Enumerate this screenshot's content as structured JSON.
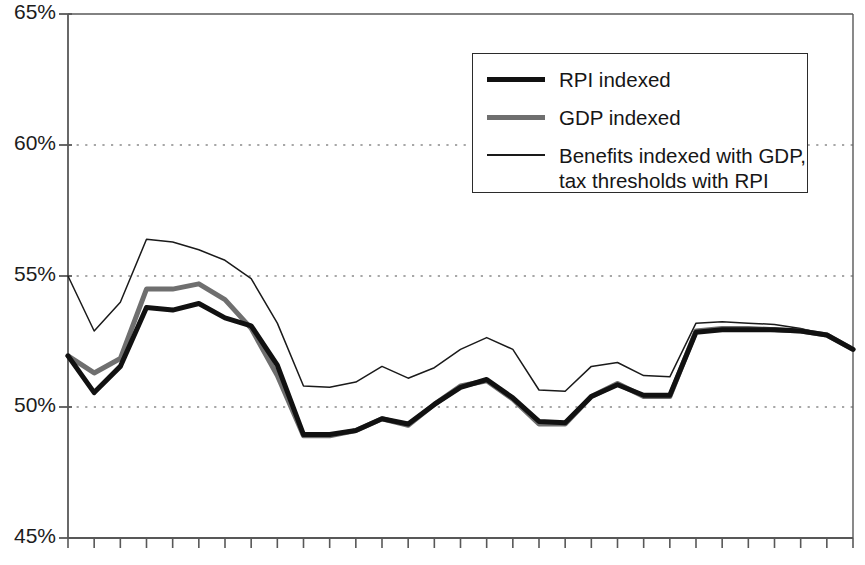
{
  "chart_data": {
    "type": "line",
    "title": "",
    "subtitle": "",
    "xlabel": "",
    "ylabel": "",
    "ylim": [
      45,
      65
    ],
    "xlim": [
      0,
      30
    ],
    "y_ticks": [
      45,
      50,
      55,
      60,
      65
    ],
    "y_tick_labels": [
      "45%",
      "50%",
      "55%",
      "60%",
      "65%"
    ],
    "x_tick_labels": [],
    "x_tick_count": 31,
    "grid": "horizontal-dotted",
    "legend_position": "upper-right",
    "x": [
      0,
      1,
      2,
      3,
      4,
      5,
      6,
      7,
      8,
      9,
      10,
      11,
      12,
      13,
      14,
      15,
      16,
      17,
      18,
      19,
      20,
      21,
      22,
      23,
      24,
      25,
      26,
      27,
      28,
      29,
      30
    ],
    "series": [
      {
        "name": "RPI indexed",
        "color": "#111111",
        "width": 5,
        "values": [
          51.95,
          50.55,
          51.55,
          53.8,
          53.7,
          53.95,
          53.4,
          53.1,
          51.6,
          48.95,
          48.95,
          49.1,
          49.55,
          49.35,
          50.1,
          50.75,
          51.05,
          50.35,
          49.45,
          49.4,
          50.4,
          50.85,
          50.45,
          50.45,
          52.85,
          52.95,
          52.95,
          52.95,
          52.9,
          52.75,
          52.2
        ]
      },
      {
        "name": "GDP indexed",
        "color": "#6f6f6f",
        "width": 5,
        "values": [
          51.95,
          51.3,
          51.85,
          54.5,
          54.5,
          54.7,
          54.1,
          53.0,
          51.2,
          48.9,
          48.9,
          49.1,
          49.55,
          49.3,
          50.1,
          50.8,
          51.0,
          50.3,
          49.35,
          49.35,
          50.4,
          50.9,
          50.4,
          50.4,
          52.9,
          53.0,
          53.0,
          52.95,
          52.9,
          52.75,
          52.2
        ]
      },
      {
        "name": "Benefits indexed with GDP,\ntax thresholds with RPI",
        "color": "#1a1a1a",
        "width": 1.5,
        "values": [
          55.0,
          52.9,
          54.0,
          56.4,
          56.3,
          56.0,
          55.6,
          54.9,
          53.2,
          50.8,
          50.75,
          50.95,
          51.55,
          51.1,
          51.5,
          52.2,
          52.65,
          52.2,
          50.65,
          50.6,
          51.55,
          51.7,
          51.2,
          51.15,
          53.2,
          53.25,
          53.2,
          53.15,
          53.0,
          52.75,
          52.2
        ]
      }
    ]
  },
  "axis": {
    "labels": [
      "65%",
      "60%",
      "55%",
      "50%",
      "45%"
    ]
  },
  "legend": {
    "items": [
      {
        "label": "RPI indexed",
        "swatch": "thick-black-line-swatch"
      },
      {
        "label": "GDP indexed",
        "swatch": "thick-gray-line-swatch"
      },
      {
        "label": "Benefits indexed with GDP,\ntax thresholds with RPI",
        "swatch": "thin-black-line-swatch"
      }
    ]
  },
  "colors": {
    "rpi": "#111111",
    "gdp": "#6f6f6f",
    "benefits": "#1a1a1a",
    "axis": "#585858",
    "grid": "#8a8a8a",
    "background": "#ffffff"
  }
}
